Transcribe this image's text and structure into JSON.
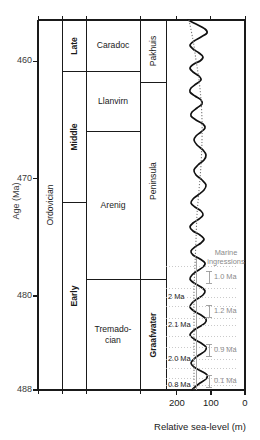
{
  "chart_data": {
    "type": "line",
    "title": "",
    "ylabel": "Age (Ma)",
    "xlabel": "Relative sea-level (m)",
    "ylim": [
      488,
      456.5
    ],
    "xlim": [
      232,
      0
    ],
    "y_ticks": [
      460,
      470,
      480,
      488
    ],
    "x_ticks": [
      200,
      100,
      0
    ],
    "x_axis_reversed": true,
    "grid": false,
    "columns": [
      {
        "name": "system",
        "cells": [
          {
            "label": "Ordovician",
            "from": 488,
            "to": 456.5,
            "orientation": "vertical",
            "bold": false
          }
        ]
      },
      {
        "name": "series",
        "cells": [
          {
            "label": "Late",
            "from": 460.9,
            "to": 456.5,
            "orientation": "vertical",
            "bold": true
          },
          {
            "label": "Middle",
            "from": 472.0,
            "to": 460.9,
            "orientation": "vertical",
            "bold": true
          },
          {
            "label": "Early",
            "from": 488.0,
            "to": 472.0,
            "orientation": "vertical",
            "bold": true
          }
        ]
      },
      {
        "name": "stage",
        "cells": [
          {
            "label": "Caradoc",
            "from": 460.9,
            "to": 456.5,
            "orientation": "horizontal",
            "bold": false
          },
          {
            "label": "Llanvirn",
            "from": 466.0,
            "to": 460.9,
            "orientation": "horizontal",
            "bold": false
          },
          {
            "label": "Arenig",
            "from": 478.6,
            "to": 466.0,
            "orientation": "horizontal",
            "bold": false
          },
          {
            "label": "Tremado-\ncian",
            "from": 488.0,
            "to": 478.6,
            "orientation": "horizontal",
            "bold": false
          }
        ]
      },
      {
        "name": "formation",
        "cells": [
          {
            "label": "Pakhuis",
            "from": 461.8,
            "to": 456.5,
            "orientation": "vertical",
            "bold": false
          },
          {
            "label": "Peninsula",
            "from": 478.6,
            "to": 461.8,
            "orientation": "vertical",
            "bold": false
          },
          {
            "label": "Graafwater",
            "from": 488.0,
            "to": 478.6,
            "orientation": "vertical",
            "bold": true
          }
        ]
      }
    ],
    "series": [
      {
        "name": "relative sea-level curve",
        "style": "solid",
        "points_xy_pixels": [
          [
            188,
            20
          ],
          [
            196,
            24
          ],
          [
            205,
            29
          ],
          [
            207,
            33
          ],
          [
            201,
            37
          ],
          [
            194,
            41
          ],
          [
            190,
            45
          ],
          [
            193,
            49
          ],
          [
            199,
            53
          ],
          [
            203,
            57
          ],
          [
            200,
            61
          ],
          [
            194,
            64
          ],
          [
            190,
            68
          ],
          [
            193,
            72
          ],
          [
            199,
            76
          ],
          [
            201,
            80
          ],
          [
            196,
            84
          ],
          [
            191,
            88
          ],
          [
            190,
            92
          ],
          [
            195,
            96
          ],
          [
            201,
            100
          ],
          [
            202,
            104
          ],
          [
            197,
            108
          ],
          [
            192,
            112
          ],
          [
            191,
            116
          ],
          [
            196,
            120
          ],
          [
            203,
            124
          ],
          [
            205,
            128
          ],
          [
            201,
            132
          ],
          [
            196,
            136
          ],
          [
            194,
            140
          ],
          [
            197,
            145
          ],
          [
            203,
            150
          ],
          [
            206,
            155
          ],
          [
            204,
            160
          ],
          [
            198,
            165
          ],
          [
            194,
            170
          ],
          [
            196,
            175
          ],
          [
            202,
            180
          ],
          [
            206,
            185
          ],
          [
            204,
            190
          ],
          [
            198,
            195
          ],
          [
            193,
            199
          ],
          [
            191,
            203
          ],
          [
            195,
            207
          ],
          [
            201,
            211
          ],
          [
            203,
            215
          ],
          [
            199,
            219
          ],
          [
            193,
            223
          ],
          [
            190,
            227
          ],
          [
            193,
            231
          ],
          [
            200,
            235
          ],
          [
            204,
            239
          ],
          [
            201,
            243
          ],
          [
            195,
            247
          ],
          [
            191,
            251
          ],
          [
            193,
            255
          ],
          [
            200,
            259
          ],
          [
            205,
            263
          ],
          [
            203,
            267
          ],
          [
            197,
            271
          ],
          [
            192,
            275
          ],
          [
            190,
            279
          ],
          [
            194,
            283
          ],
          [
            201,
            287
          ],
          [
            205,
            291
          ],
          [
            203,
            295
          ],
          [
            197,
            299
          ],
          [
            192,
            303
          ],
          [
            190,
            307
          ],
          [
            194,
            311
          ],
          [
            201,
            315
          ],
          [
            206,
            319
          ],
          [
            205,
            323
          ],
          [
            199,
            327
          ],
          [
            193,
            331
          ],
          [
            190,
            335
          ],
          [
            194,
            339
          ],
          [
            201,
            343
          ],
          [
            206,
            347
          ],
          [
            205,
            351
          ],
          [
            199,
            355
          ],
          [
            194,
            359
          ],
          [
            191,
            363
          ],
          [
            194,
            367
          ],
          [
            201,
            371
          ],
          [
            207,
            375
          ],
          [
            206,
            379
          ],
          [
            200,
            383
          ],
          [
            195,
            387
          ],
          [
            192,
            390
          ]
        ]
      },
      {
        "name": "long-term trend",
        "style": "dotted",
        "points_xy_pixels": [
          [
            189,
            20
          ],
          [
            193,
            40
          ],
          [
            196,
            60
          ],
          [
            199,
            80
          ],
          [
            201,
            100
          ],
          [
            202,
            120
          ],
          [
            202,
            140
          ],
          [
            201,
            165
          ],
          [
            199,
            190
          ],
          [
            197,
            215
          ],
          [
            196,
            240
          ],
          [
            195,
            265
          ],
          [
            194,
            290
          ],
          [
            194,
            315
          ],
          [
            194,
            340
          ],
          [
            194,
            365
          ],
          [
            194,
            390
          ]
        ]
      }
    ],
    "annotations_left": [
      {
        "label": "2 Ma",
        "y_px": 297
      },
      {
        "label": "2.1 Ma",
        "y_px": 325
      },
      {
        "label": "2.0 Ma",
        "y_px": 359
      },
      {
        "label": "0.8 Ma",
        "y_px": 385
      }
    ],
    "annotations_right": [
      {
        "label": "Marine",
        "y_px": 253,
        "type": "header"
      },
      {
        "label": "ingressions",
        "y_px": 262,
        "type": "header"
      },
      {
        "label": "1.0 Ma",
        "y_px": 277,
        "type": "interval"
      },
      {
        "label": "1.2 Ma",
        "y_px": 311,
        "type": "interval"
      },
      {
        "label": "0.9 Ma",
        "y_px": 350,
        "type": "interval"
      },
      {
        "label": "0.1 Ma",
        "y_px": 381,
        "type": "interval"
      }
    ],
    "colors": {
      "axis": "#1a1a1a",
      "curve": "#111111",
      "trend": "#777777",
      "annotation_grey": "#8a8a8a",
      "background": "#ffffff"
    }
  }
}
